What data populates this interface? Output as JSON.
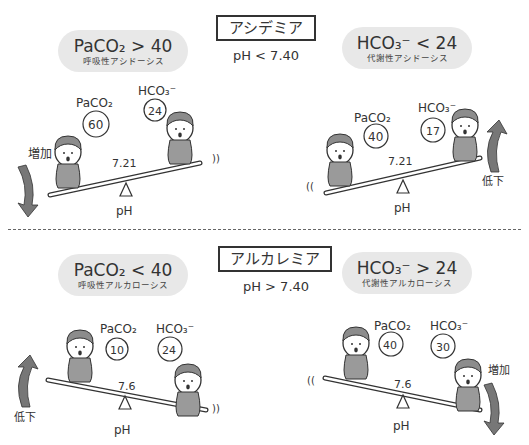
{
  "header": {
    "caption": "図 酸塩基平衡"
  },
  "acidemia": {
    "title": "アシデミア",
    "ph_condition": "pH < 7.40",
    "respiratory": {
      "formula": "PaCO₂ > 40",
      "name": "呼吸性アシドーシス"
    },
    "metabolic": {
      "formula": "HCO₃⁻ < 24",
      "name": "代謝性アシドーシス"
    },
    "left_scene": {
      "paco2_label": "PaCO₂",
      "paco2_value": "60",
      "hco3_label": "HCO₃⁻",
      "hco3_value": "24",
      "ph_value": "7.21",
      "ph_label": "pH",
      "change": "増加",
      "change_direction": "down"
    },
    "right_scene": {
      "paco2_label": "PaCO₂",
      "paco2_value": "40",
      "hco3_label": "HCO₃⁻",
      "hco3_value": "17",
      "ph_value": "7.21",
      "ph_label": "pH",
      "change": "低下",
      "change_direction": "up"
    }
  },
  "alkalemia": {
    "title": "アルカレミア",
    "ph_condition": "pH > 7.40",
    "respiratory": {
      "formula": "PaCO₂ < 40",
      "name": "呼吸性アルカローシス"
    },
    "metabolic": {
      "formula": "HCO₃⁻ > 24",
      "name": "代謝性アルカローシス"
    },
    "left_scene": {
      "paco2_label": "PaCO₂",
      "paco2_value": "10",
      "hco3_label": "HCO₃⁻",
      "hco3_value": "24",
      "ph_value": "7.6",
      "ph_label": "pH",
      "change": "低下",
      "change_direction": "up"
    },
    "right_scene": {
      "paco2_label": "PaCO₂",
      "paco2_value": "40",
      "hco3_label": "HCO₃⁻",
      "hco3_value": "30",
      "ph_value": "7.6",
      "ph_label": "pH",
      "change": "増加",
      "change_direction": "down"
    }
  },
  "colors": {
    "pill_bg": "#e8e8e8",
    "figure_fill": "#9a9a9a",
    "arrow_fill": "#777777",
    "line": "#333333"
  }
}
